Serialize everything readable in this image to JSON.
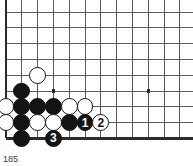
{
  "figure": {
    "type": "go-board-diagram",
    "caption": "185",
    "background_color": "#ffffff",
    "line_color": "#4a4a4a",
    "edge_color": "#2b2b2b",
    "black_color": "#141414",
    "white_color": "#ffffff"
  },
  "board": {
    "origin_x": 6,
    "origin_y": 12,
    "cell": 15.8,
    "cols": 12,
    "rows": 9,
    "left_edge": true,
    "bottom_edge": true,
    "top_edge": false,
    "right_edge": false,
    "star_points": [
      {
        "col": 3,
        "row": 5
      },
      {
        "col": 9,
        "row": 5
      }
    ]
  },
  "stones": [
    {
      "col": 2,
      "row": 4,
      "color": "white",
      "label": ""
    },
    {
      "col": 1,
      "row": 5,
      "color": "black",
      "label": ""
    },
    {
      "col": 0,
      "row": 6,
      "color": "white",
      "label": ""
    },
    {
      "col": 1,
      "row": 6,
      "color": "black",
      "label": ""
    },
    {
      "col": 2,
      "row": 6,
      "color": "black",
      "label": ""
    },
    {
      "col": 3,
      "row": 6,
      "color": "black",
      "label": ""
    },
    {
      "col": 4,
      "row": 6,
      "color": "white",
      "label": ""
    },
    {
      "col": 5,
      "row": 6,
      "color": "white",
      "label": ""
    },
    {
      "col": 0,
      "row": 7,
      "color": "white",
      "label": ""
    },
    {
      "col": 1,
      "row": 7,
      "color": "black",
      "label": ""
    },
    {
      "col": 2,
      "row": 7,
      "color": "white",
      "label": ""
    },
    {
      "col": 3,
      "row": 7,
      "color": "white",
      "label": ""
    },
    {
      "col": 4,
      "row": 7,
      "color": "black",
      "label": ""
    },
    {
      "col": 5,
      "row": 7,
      "color": "black",
      "label": "1"
    },
    {
      "col": 6,
      "row": 7,
      "color": "white",
      "label": "2"
    },
    {
      "col": 1,
      "row": 8,
      "color": "black",
      "label": ""
    },
    {
      "col": 3,
      "row": 8,
      "color": "black",
      "label": "3"
    }
  ],
  "moves": [
    {
      "number": "1",
      "color": "black"
    },
    {
      "number": "2",
      "color": "white"
    },
    {
      "number": "3",
      "color": "black"
    }
  ]
}
